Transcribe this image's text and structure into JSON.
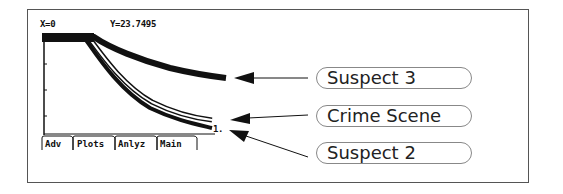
{
  "screen": {
    "cursor_x": "X=0",
    "cursor_y": "Y=23.7495",
    "point_marker": "1.",
    "tabs": [
      {
        "label": "Adv"
      },
      {
        "label": "Plots"
      },
      {
        "label": "Anlyz"
      },
      {
        "label": "Main"
      }
    ]
  },
  "callouts": [
    {
      "label": "Suspect 3",
      "target": "upper curve"
    },
    {
      "label": "Crime Scene",
      "target": "outlined middle curve"
    },
    {
      "label": "Suspect 2",
      "target": "lower curve"
    }
  ],
  "colors": {
    "curve": "#111111",
    "frame": "#555555",
    "label_border": "#888888"
  }
}
